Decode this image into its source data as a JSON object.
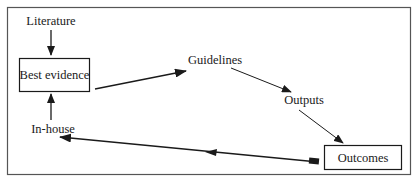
{
  "diagram": {
    "nodes": {
      "literature": {
        "label": "Literature",
        "boxed": false
      },
      "best_evidence": {
        "label": "Best evidence",
        "boxed": true
      },
      "guidelines": {
        "label": "Guidelines",
        "boxed": false
      },
      "outputs": {
        "label": "Outputs",
        "boxed": false
      },
      "outcomes": {
        "label": "Outcomes",
        "boxed": true
      },
      "in_house": {
        "label": "In-house",
        "boxed": false
      }
    },
    "edges": [
      {
        "from": "Literature",
        "to": "Best evidence"
      },
      {
        "from": "Best evidence",
        "to": "Guidelines"
      },
      {
        "from": "Guidelines",
        "to": "Outputs"
      },
      {
        "from": "Outputs",
        "to": "Outcomes"
      },
      {
        "from": "Outcomes",
        "to": "In-house"
      },
      {
        "from": "In-house",
        "to": "Best evidence"
      }
    ],
    "colors": {
      "stroke": "#1a1a1a",
      "background": "#ffffff",
      "frame": "#555555"
    }
  }
}
